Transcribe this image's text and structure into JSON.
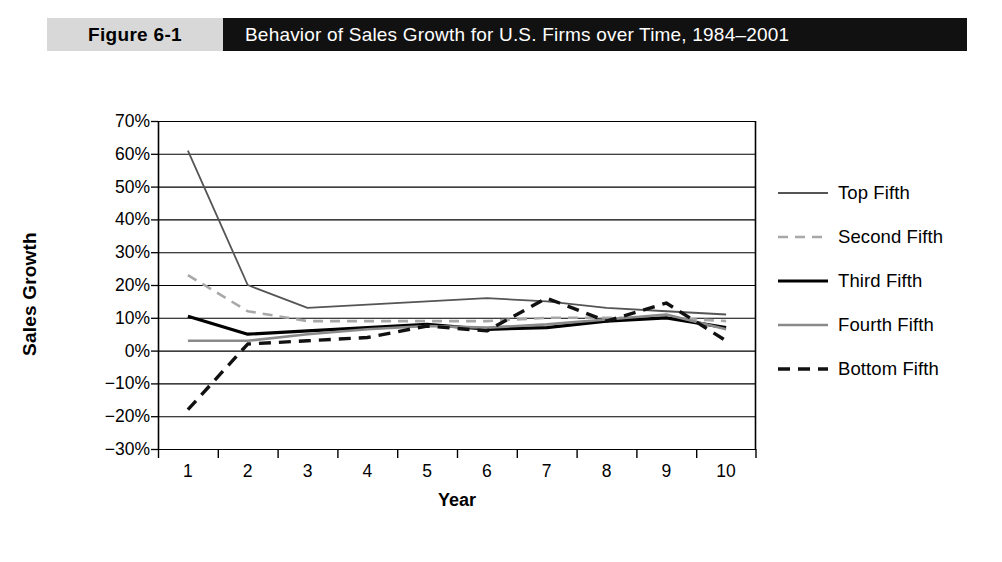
{
  "header": {
    "badge": "Figure 6-1",
    "title": "Behavior of Sales Growth for U.S. Firms over Time, 1984–2001"
  },
  "chart_data": {
    "type": "line",
    "title": "Behavior of Sales Growth for U.S. Firms over Time, 1984–2001",
    "xlabel": "Year",
    "ylabel": "Sales Growth",
    "x": [
      1,
      2,
      3,
      4,
      5,
      6,
      7,
      8,
      9,
      10
    ],
    "categories": [
      "1",
      "2",
      "3",
      "4",
      "5",
      "6",
      "7",
      "8",
      "9",
      "10"
    ],
    "ylim": [
      -30,
      70
    ],
    "ytick_labels": [
      "70%",
      "60%",
      "50%",
      "40%",
      "30%",
      "20%",
      "10%",
      "0%",
      "−10%",
      "−20%",
      "−30%"
    ],
    "ytick_values": [
      70,
      60,
      50,
      40,
      30,
      20,
      10,
      0,
      -10,
      -20,
      -30
    ],
    "grid": true,
    "legend_position": "right",
    "series": [
      {
        "name": "Top Fifth",
        "values": [
          61,
          20,
          13,
          14,
          15,
          16,
          15,
          13,
          12,
          11
        ],
        "color": "#555555",
        "width": 1.8,
        "dash": "none"
      },
      {
        "name": "Second Fifth",
        "values": [
          23,
          12,
          9,
          9,
          9,
          9,
          10,
          10,
          10,
          9
        ],
        "color": "#a8a8a8",
        "width": 2.6,
        "dash": "10,7"
      },
      {
        "name": "Third Fifth",
        "values": [
          10.5,
          5,
          6,
          7,
          8,
          6.5,
          7,
          9,
          10,
          7
        ],
        "color": "#000000",
        "width": 3.2,
        "dash": "none"
      },
      {
        "name": "Fourth Fifth",
        "values": [
          3,
          3,
          5,
          6.5,
          7.5,
          7,
          8,
          9.5,
          11,
          6.5
        ],
        "color": "#8a8a8a",
        "width": 2.6,
        "dash": "none"
      },
      {
        "name": "Bottom Fifth",
        "values": [
          -18,
          2,
          3,
          4,
          7.5,
          6,
          16,
          9,
          14.5,
          3
        ]
      }
    ],
    "bottom_fifth_style": {
      "color": "#111111",
      "width": 3.4,
      "dash": "12,8"
    }
  },
  "legend": {
    "items": [
      {
        "label": "Top Fifth",
        "name": "legend-item-top-fifth"
      },
      {
        "label": "Second Fifth",
        "name": "legend-item-second-fifth"
      },
      {
        "label": "Third Fifth",
        "name": "legend-item-third-fifth"
      },
      {
        "label": "Fourth Fifth",
        "name": "legend-item-fourth-fifth"
      },
      {
        "label": "Bottom Fifth",
        "name": "legend-item-bottom-fifth"
      }
    ]
  }
}
